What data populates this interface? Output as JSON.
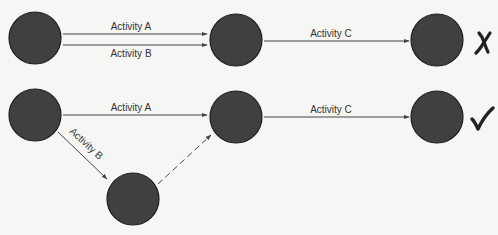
{
  "diagram": {
    "title_partial": "",
    "colors": {
      "background": "#f6f6f4",
      "node_fill": "#404040",
      "node_stroke": "#1e1e1e",
      "edge": "#444444",
      "label": "#333333"
    },
    "top": {
      "edges": [
        {
          "label": "Activity A",
          "style": "solid"
        },
        {
          "label": "Activity B",
          "style": "solid"
        },
        {
          "label": "Activity C",
          "style": "solid"
        }
      ],
      "verdict": {
        "symbol": "✗",
        "meaning": "incorrect"
      }
    },
    "bottom": {
      "edges": [
        {
          "label": "Activity A",
          "style": "solid"
        },
        {
          "label": "Activity B",
          "style": "solid"
        },
        {
          "label": "",
          "style": "dashed",
          "meaning": "dummy activity"
        },
        {
          "label": "Activity C",
          "style": "solid"
        }
      ],
      "verdict": {
        "symbol": "✓",
        "meaning": "correct"
      }
    }
  }
}
